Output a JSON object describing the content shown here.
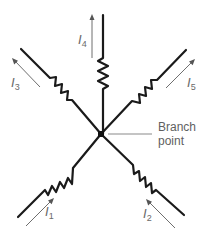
{
  "diagram": {
    "type": "circuit-branch-point",
    "branch_point_label": {
      "line1": "Branch",
      "line2": "point"
    },
    "currents": [
      {
        "id": "I1",
        "symbol": "I",
        "subscript": "1",
        "direction": "into branch point",
        "position": "lower-left"
      },
      {
        "id": "I2",
        "symbol": "I",
        "subscript": "2",
        "direction": "into branch point",
        "position": "lower-right"
      },
      {
        "id": "I3",
        "symbol": "I",
        "subscript": "3",
        "direction": "out of branch point",
        "position": "upper-left"
      },
      {
        "id": "I4",
        "symbol": "I",
        "subscript": "4",
        "direction": "out of branch point",
        "position": "top"
      },
      {
        "id": "I5",
        "symbol": "I",
        "subscript": "5",
        "direction": "out of branch point",
        "position": "upper-right"
      }
    ],
    "colors": {
      "wire": "#1a1a1a",
      "arrow": "#6e6e6e",
      "label": "#6a6a6a"
    }
  }
}
